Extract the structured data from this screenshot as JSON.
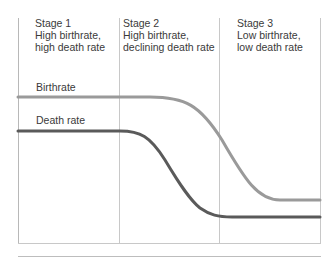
{
  "diagram": {
    "stages": [
      {
        "name": "Stage 1",
        "line1": "High birthrate,",
        "line2": "high death rate"
      },
      {
        "name": "Stage 2",
        "line1": "High birthrate,",
        "line2": "declining death rate"
      },
      {
        "name": "Stage 3",
        "line1": "Low birthrate,",
        "line2": "low death rate"
      }
    ],
    "series": [
      {
        "name": "Birthrate",
        "color": "#9a9a9a"
      },
      {
        "name": "Death rate",
        "color": "#5a5a5a"
      }
    ],
    "colors": {
      "divider": "#c8c8c8",
      "axis": "#b8b8b8",
      "text": "#3a3a3a"
    }
  }
}
